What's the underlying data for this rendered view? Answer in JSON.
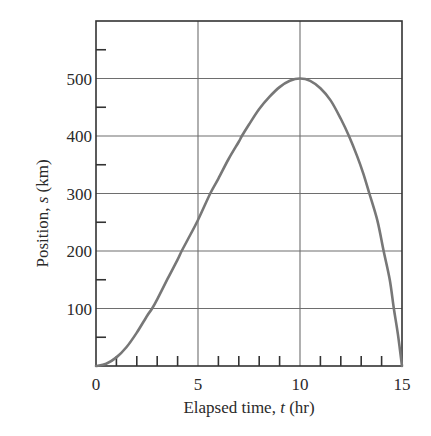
{
  "chart_data": {
    "type": "line",
    "title": "",
    "xlabel": "Elapsed time, t (hr)",
    "xlabel_parts": [
      "Elapsed time, ",
      "t",
      " (hr)"
    ],
    "ylabel": "Position, s (km)",
    "ylabel_parts": [
      "Position, ",
      "s",
      " (km)"
    ],
    "xlim": [
      0,
      15
    ],
    "ylim": [
      0,
      600
    ],
    "x_ticks_major": [
      0,
      5,
      10,
      15
    ],
    "x_tick_labels": [
      "0",
      "5",
      "10",
      "15"
    ],
    "x_ticks_minor": [
      1,
      2,
      3,
      4,
      6,
      7,
      8,
      9,
      11,
      12,
      13,
      14
    ],
    "y_ticks_major": [
      100,
      200,
      300,
      400,
      500
    ],
    "y_tick_labels": [
      "100",
      "200",
      "300",
      "400",
      "500"
    ],
    "y_ticks_minor": [
      50,
      150,
      250,
      350,
      450,
      550
    ],
    "grid": true,
    "legend": null,
    "series": [
      {
        "name": "s(t)",
        "color": "#777777",
        "x": [
          0,
          0.5,
          1,
          1.5,
          2,
          2.5,
          2.75,
          3,
          3.5,
          4,
          4.2,
          4.5,
          5,
          5.6,
          6,
          6.5,
          7,
          7.15,
          7.5,
          8,
          8.5,
          9,
          9.5,
          10,
          10.5,
          11,
          11.5,
          12,
          12.4,
          12.8,
          13.1,
          13.4,
          13.8,
          14.1,
          14.4,
          14.6,
          14.8,
          15
        ],
        "values": [
          0,
          4,
          15,
          33,
          58,
          87,
          100,
          116,
          151,
          185,
          200,
          220,
          254,
          300,
          326,
          360,
          390,
          400,
          420,
          447,
          468,
          485,
          496,
          500,
          496,
          483,
          462,
          430,
          400,
          365,
          335,
          300,
          252,
          200,
          150,
          100,
          55,
          0
        ]
      }
    ]
  }
}
